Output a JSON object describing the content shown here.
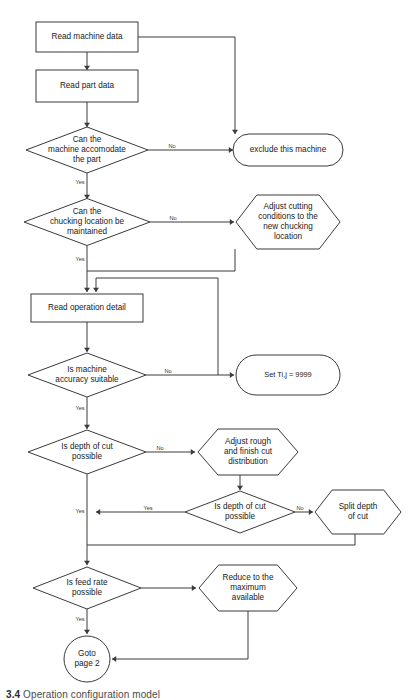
{
  "diagram": {
    "caption_number": "3.4",
    "caption_text": "Operation configuration model",
    "colors": {
      "stroke": "#3a3a3a",
      "fill": "#ffffff",
      "text": "#1a1a1a",
      "background": "#ffffff"
    }
  },
  "nodes": [
    {
      "id": "read-machine-data",
      "shape": "process",
      "label": "Read machine data",
      "lines": [
        "Read machine data"
      ],
      "x": 87,
      "y": 37,
      "w": 102,
      "h": 30
    },
    {
      "id": "read-part-data",
      "shape": "process",
      "label": "Read part data",
      "lines": [
        "Read part data"
      ],
      "x": 87,
      "y": 86,
      "w": 102,
      "h": 32
    },
    {
      "id": "can-machine-accomodate",
      "shape": "decision",
      "label": "Can the machine accomodate the part",
      "lines": [
        "Can the",
        "machine accomodate",
        "the part"
      ],
      "x": 87,
      "y": 150,
      "w": 122,
      "h": 46
    },
    {
      "id": "exclude-this-machine",
      "shape": "terminator",
      "label": "exclude this machine",
      "lines": [
        "exclude this machine"
      ],
      "x": 288,
      "y": 150,
      "w": 110,
      "h": 32
    },
    {
      "id": "can-chucking-maintained",
      "shape": "decision",
      "label": "Can the chucking location be maintained",
      "lines": [
        "Can the",
        "chucking location be",
        "maintained"
      ],
      "x": 87,
      "y": 222,
      "w": 126,
      "h": 47
    },
    {
      "id": "adjust-cutting-conditions",
      "shape": "hexagon",
      "label": "Adjust cutting conditions to the new chucking location",
      "lines": [
        "Adjust cutting",
        "conditions to the",
        "new chucking",
        "location"
      ],
      "x": 288,
      "y": 222,
      "w": 104,
      "h": 54
    },
    {
      "id": "read-operation-detail",
      "shape": "process",
      "label": "Read operation detail",
      "lines": [
        "Read operation detail"
      ],
      "x": 87,
      "y": 308,
      "w": 112,
      "h": 28
    },
    {
      "id": "is-machine-accuracy-suitable",
      "shape": "decision",
      "label": "Is machine accuracy suitable",
      "lines": [
        "Is machine",
        "accuracy suitable"
      ],
      "x": 87,
      "y": 375,
      "w": 118,
      "h": 44
    },
    {
      "id": "set-tij-9999",
      "shape": "terminator",
      "label": "Set Ti,j = 9999",
      "lines": [
        "Set Ti,j = 9999"
      ],
      "x": 288,
      "y": 375,
      "w": 104,
      "h": 40
    },
    {
      "id": "is-depth-of-cut-possible-1",
      "shape": "decision",
      "label": "Is depth of cut possible",
      "lines": [
        "Is depth of cut",
        "possible"
      ],
      "x": 87,
      "y": 452,
      "w": 118,
      "h": 44
    },
    {
      "id": "adjust-rough-finish-cut",
      "shape": "hexagon",
      "label": "Adjust rough and finish cut distribution",
      "lines": [
        "Adjust rough",
        "and finish cut",
        "distribution"
      ],
      "x": 248,
      "y": 452,
      "w": 100,
      "h": 46
    },
    {
      "id": "is-depth-of-cut-possible-2",
      "shape": "decision",
      "label": "Is depth of cut possible",
      "lines": [
        "Is depth of cut",
        "possible"
      ],
      "x": 240,
      "y": 512,
      "w": 110,
      "h": 42
    },
    {
      "id": "split-depth-of-cut",
      "shape": "hexagon",
      "label": "Split depth of cut",
      "lines": [
        "Split depth",
        "of cut"
      ],
      "x": 358,
      "y": 512,
      "w": 86,
      "h": 44
    },
    {
      "id": "is-feed-rate-possible",
      "shape": "decision",
      "label": "Is feed rate possible",
      "lines": [
        "Is feed rate",
        "possible"
      ],
      "x": 87,
      "y": 588,
      "w": 108,
      "h": 42
    },
    {
      "id": "reduce-to-maximum-available",
      "shape": "hexagon",
      "label": "Reduce to the maximum available",
      "lines": [
        "Reduce to the",
        "maximum",
        "available"
      ],
      "x": 248,
      "y": 588,
      "w": 98,
      "h": 46
    },
    {
      "id": "goto-page-2",
      "shape": "terminator-circle",
      "label": "Goto page 2",
      "lines": [
        "Goto",
        "page 2"
      ],
      "x": 87,
      "y": 659,
      "w": 46,
      "h": 46
    }
  ],
  "edges": [
    {
      "id": "e-machine-to-part",
      "from": "read-machine-data",
      "to": "read-part-data",
      "label": "",
      "path": "M87,52 L87,70"
    },
    {
      "id": "e-machine-to-exclude",
      "from": "read-machine-data",
      "to": "exclude-this-machine",
      "label": "",
      "path": "M138,37 L235,37 L235,134"
    },
    {
      "id": "e-part-to-accomodate",
      "from": "read-part-data",
      "to": "can-machine-accomodate",
      "label": "",
      "path": "M87,102 L87,127"
    },
    {
      "id": "e-accomodate-no",
      "from": "can-machine-accomodate",
      "to": "exclude-this-machine",
      "label": "No",
      "path": "M148,150 L233,150",
      "label_x": 172,
      "label_y": 147
    },
    {
      "id": "e-accomodate-yes",
      "from": "can-machine-accomodate",
      "to": "can-chucking-maintained",
      "label": "Yes",
      "path": "M87,173 L87,199",
      "label_x": 80,
      "label_y": 183
    },
    {
      "id": "e-chucking-no",
      "from": "can-chucking-maintained",
      "to": "adjust-cutting-conditions",
      "label": "No",
      "path": "M150,222 L234,222",
      "label_x": 173,
      "label_y": 219
    },
    {
      "id": "e-chucking-yes",
      "from": "can-chucking-maintained",
      "to": "read-operation-detail",
      "label": "Yes",
      "path": "M87,246 L87,292",
      "label_x": 80,
      "label_y": 260
    },
    {
      "id": "e-adjust-cutting-back",
      "from": "adjust-cutting-conditions",
      "to": "read-operation-detail",
      "label": "",
      "path": "M235,249 L235,271 L87,271"
    },
    {
      "id": "e-settij-back",
      "from": "set-tij-9999",
      "to": "read-operation-detail",
      "label": "",
      "path": "M218,375 L218,278 L96,278 L96,292"
    },
    {
      "id": "e-operation-to-accuracy",
      "from": "read-operation-detail",
      "to": "is-machine-accuracy-suitable",
      "label": "",
      "path": "M87,322 L87,352"
    },
    {
      "id": "e-accuracy-no",
      "from": "is-machine-accuracy-suitable",
      "to": "set-tij-9999",
      "label": "No",
      "path": "M146,375 L234,375",
      "label_x": 168,
      "label_y": 372
    },
    {
      "id": "e-accuracy-yes",
      "from": "is-machine-accuracy-suitable",
      "to": "is-depth-of-cut-possible-1",
      "label": "Yes",
      "path": "M87,397 L87,429",
      "label_x": 80,
      "label_y": 409
    },
    {
      "id": "e-depth1-no",
      "from": "is-depth-of-cut-possible-1",
      "to": "adjust-rough-finish-cut",
      "label": "No",
      "path": "M146,452 L195,452",
      "label_x": 160,
      "label_y": 449
    },
    {
      "id": "e-rough-to-depth2",
      "from": "adjust-rough-finish-cut",
      "to": "is-depth-of-cut-possible-2",
      "label": "",
      "path": "M240,475 L240,490"
    },
    {
      "id": "e-depth2-no",
      "from": "is-depth-of-cut-possible-2",
      "to": "split-depth-of-cut",
      "label": "No",
      "path": "M295,512 L313,512",
      "label_x": 300,
      "label_y": 509
    },
    {
      "id": "e-depth2-yes",
      "from": "is-depth-of-cut-possible-2",
      "to": "is-feed-rate-possible",
      "label": "Yes",
      "path": "M185,512 L96,512",
      "label_x": 148,
      "label_y": 509
    },
    {
      "id": "e-depth1-yes",
      "from": "is-depth-of-cut-possible-1",
      "to": "is-feed-rate-possible",
      "label": "Yes",
      "path": "M87,474 L87,565",
      "label_x": 80,
      "label_y": 512
    },
    {
      "id": "e-split-back",
      "from": "split-depth-of-cut",
      "to": "is-feed-rate-possible",
      "label": "",
      "path": "M355,534 L355,545 L87,545"
    },
    {
      "id": "e-feed-no",
      "from": "is-feed-rate-possible",
      "to": "reduce-to-maximum-available",
      "label": "",
      "path": "M141,588 L196,588"
    },
    {
      "id": "e-feed-yes",
      "from": "is-feed-rate-possible",
      "to": "goto-page-2",
      "label": "Yes",
      "path": "M87,609 L87,634",
      "label_x": 80,
      "label_y": 620
    },
    {
      "id": "e-reduce-back",
      "from": "reduce-to-maximum-available",
      "to": "goto-page-2",
      "label": "",
      "path": "M248,611 L248,659 L112,659"
    }
  ],
  "arrowheads": [
    {
      "id": "a-part-data",
      "x": 87,
      "y": 70,
      "dir": "down"
    },
    {
      "id": "a-accomodate",
      "x": 87,
      "y": 127,
      "dir": "down"
    },
    {
      "id": "a-exclude-top",
      "x": 235,
      "y": 134,
      "dir": "down"
    },
    {
      "id": "a-exclude-left",
      "x": 233,
      "y": 150,
      "dir": "right"
    },
    {
      "id": "a-chucking",
      "x": 87,
      "y": 199,
      "dir": "down"
    },
    {
      "id": "a-adjust-cutting",
      "x": 234,
      "y": 222,
      "dir": "right"
    },
    {
      "id": "a-operation-1",
      "x": 87,
      "y": 292,
      "dir": "down"
    },
    {
      "id": "a-operation-2",
      "x": 96,
      "y": 292,
      "dir": "down"
    },
    {
      "id": "a-accuracy",
      "x": 87,
      "y": 352,
      "dir": "down"
    },
    {
      "id": "a-settij",
      "x": 234,
      "y": 375,
      "dir": "right"
    },
    {
      "id": "a-depth1",
      "x": 87,
      "y": 429,
      "dir": "down"
    },
    {
      "id": "a-rough",
      "x": 195,
      "y": 452,
      "dir": "right"
    },
    {
      "id": "a-depth2",
      "x": 240,
      "y": 490,
      "dir": "down"
    },
    {
      "id": "a-split",
      "x": 313,
      "y": 512,
      "dir": "right"
    },
    {
      "id": "a-yes-merge",
      "x": 96,
      "y": 512,
      "dir": "left"
    },
    {
      "id": "a-feedrate",
      "x": 87,
      "y": 565,
      "dir": "down"
    },
    {
      "id": "a-reduce",
      "x": 196,
      "y": 588,
      "dir": "right"
    },
    {
      "id": "a-goto",
      "x": 87,
      "y": 634,
      "dir": "down"
    },
    {
      "id": "a-goto-right",
      "x": 112,
      "y": 659,
      "dir": "left"
    }
  ]
}
